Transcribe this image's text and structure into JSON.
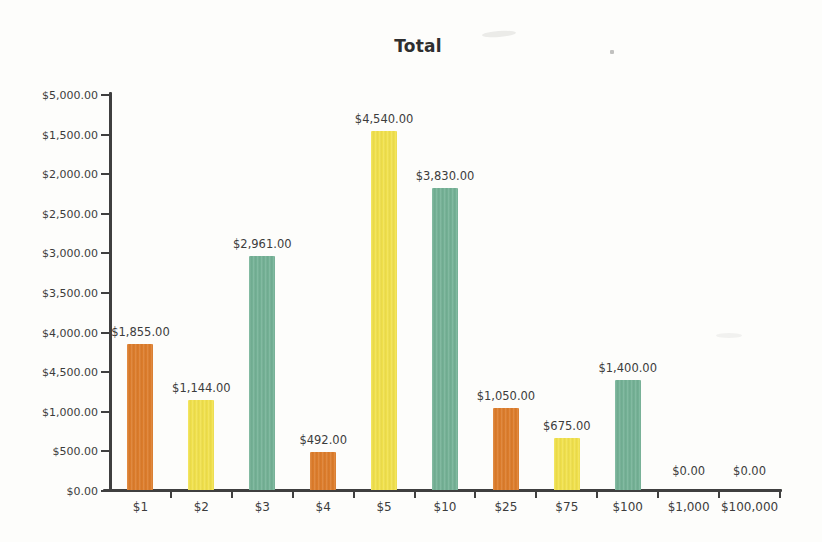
{
  "chart_data": {
    "type": "bar",
    "title": "Total",
    "categories": [
      "$1",
      "$2",
      "$3",
      "$4",
      "$5",
      "$10",
      "$25",
      "$75",
      "$100",
      "$1,000",
      "$100,000"
    ],
    "values": [
      1855,
      1144,
      2961,
      492,
      4540,
      3830,
      1050,
      675,
      1400,
      0,
      0
    ],
    "value_labels": [
      "$1,855.00",
      "$1,144.00",
      "$2,961.00",
      "$492.00",
      "$4,540.00",
      "$3,830.00",
      "$1,050.00",
      "$675.00",
      "$1,400.00",
      "$0.00",
      "$0.00"
    ],
    "bar_colors": [
      "#de7d2b",
      "#f2e24c",
      "#74b296",
      "#de7d2b",
      "#f2e24c",
      "#74b296",
      "#de7d2b",
      "#f2e24c",
      "#74b296",
      null,
      null
    ],
    "xlabel": "",
    "ylabel": "",
    "grid": false,
    "legend": false,
    "y_axis": {
      "plotted_min": 0,
      "plotted_max": 5000,
      "tick_labels_top_to_bottom": [
        "$5,000.00",
        "$1,500.00",
        "$2,000.00",
        "$2,500.00",
        "$3,000.00",
        "$3,500.00",
        "$4,000.00",
        "$4,500.00",
        "$1,000.00",
        "$500.00",
        "$0.00"
      ]
    }
  },
  "colors": {
    "axis": "#3f3f3f",
    "text": "#3c3c3c",
    "background": "#fdfdfb",
    "orange": "#de7d2b",
    "yellow": "#f2e24c",
    "teal": "#74b296"
  }
}
